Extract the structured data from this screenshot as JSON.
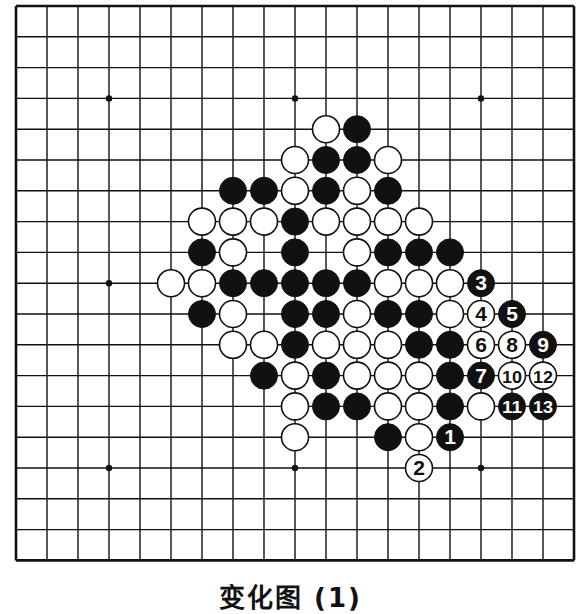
{
  "board": {
    "size": 19,
    "origin_x": 16,
    "origin_y": 6,
    "step_x": 31,
    "step_y": 30.8,
    "stone_radius": 13.5,
    "colors": {
      "line": "#111111",
      "black": "#111111",
      "white": "#ffffff",
      "background": "#ffffff"
    },
    "star_points": [
      [
        3,
        3
      ],
      [
        9,
        3
      ],
      [
        15,
        3
      ],
      [
        3,
        9
      ],
      [
        9,
        9
      ],
      [
        15,
        9
      ],
      [
        3,
        15
      ],
      [
        9,
        15
      ],
      [
        15,
        15
      ]
    ],
    "stones": [
      {
        "c": 10,
        "r": 4,
        "color": "W"
      },
      {
        "c": 11,
        "r": 4,
        "color": "B"
      },
      {
        "c": 9,
        "r": 5,
        "color": "W"
      },
      {
        "c": 10,
        "r": 5,
        "color": "B"
      },
      {
        "c": 11,
        "r": 5,
        "color": "B"
      },
      {
        "c": 12,
        "r": 5,
        "color": "W"
      },
      {
        "c": 7,
        "r": 6,
        "color": "B"
      },
      {
        "c": 8,
        "r": 6,
        "color": "B"
      },
      {
        "c": 9,
        "r": 6,
        "color": "W"
      },
      {
        "c": 10,
        "r": 6,
        "color": "B"
      },
      {
        "c": 11,
        "r": 6,
        "color": "W"
      },
      {
        "c": 12,
        "r": 6,
        "color": "B"
      },
      {
        "c": 6,
        "r": 7,
        "color": "W"
      },
      {
        "c": 7,
        "r": 7,
        "color": "W"
      },
      {
        "c": 8,
        "r": 7,
        "color": "W"
      },
      {
        "c": 9,
        "r": 7,
        "color": "B"
      },
      {
        "c": 10,
        "r": 7,
        "color": "W"
      },
      {
        "c": 11,
        "r": 7,
        "color": "W"
      },
      {
        "c": 12,
        "r": 7,
        "color": "W"
      },
      {
        "c": 13,
        "r": 7,
        "color": "W"
      },
      {
        "c": 6,
        "r": 8,
        "color": "B"
      },
      {
        "c": 7,
        "r": 8,
        "color": "W"
      },
      {
        "c": 9,
        "r": 8,
        "color": "B"
      },
      {
        "c": 11,
        "r": 8,
        "color": "W"
      },
      {
        "c": 12,
        "r": 8,
        "color": "B"
      },
      {
        "c": 13,
        "r": 8,
        "color": "B"
      },
      {
        "c": 14,
        "r": 8,
        "color": "B"
      },
      {
        "c": 5,
        "r": 9,
        "color": "W"
      },
      {
        "c": 6,
        "r": 9,
        "color": "W"
      },
      {
        "c": 7,
        "r": 9,
        "color": "B"
      },
      {
        "c": 8,
        "r": 9,
        "color": "B"
      },
      {
        "c": 9,
        "r": 9,
        "color": "B"
      },
      {
        "c": 10,
        "r": 9,
        "color": "B"
      },
      {
        "c": 11,
        "r": 9,
        "color": "B"
      },
      {
        "c": 12,
        "r": 9,
        "color": "W"
      },
      {
        "c": 13,
        "r": 9,
        "color": "W"
      },
      {
        "c": 14,
        "r": 9,
        "color": "W"
      },
      {
        "c": 6,
        "r": 10,
        "color": "B"
      },
      {
        "c": 7,
        "r": 10,
        "color": "W"
      },
      {
        "c": 9,
        "r": 10,
        "color": "B"
      },
      {
        "c": 10,
        "r": 10,
        "color": "B"
      },
      {
        "c": 11,
        "r": 10,
        "color": "W"
      },
      {
        "c": 12,
        "r": 10,
        "color": "B"
      },
      {
        "c": 13,
        "r": 10,
        "color": "B"
      },
      {
        "c": 14,
        "r": 10,
        "color": "W"
      },
      {
        "c": 7,
        "r": 11,
        "color": "W"
      },
      {
        "c": 8,
        "r": 11,
        "color": "W"
      },
      {
        "c": 9,
        "r": 11,
        "color": "B"
      },
      {
        "c": 10,
        "r": 11,
        "color": "W"
      },
      {
        "c": 11,
        "r": 11,
        "color": "W"
      },
      {
        "c": 12,
        "r": 11,
        "color": "W"
      },
      {
        "c": 13,
        "r": 11,
        "color": "B"
      },
      {
        "c": 14,
        "r": 11,
        "color": "B"
      },
      {
        "c": 8,
        "r": 12,
        "color": "B"
      },
      {
        "c": 9,
        "r": 12,
        "color": "W"
      },
      {
        "c": 10,
        "r": 12,
        "color": "B"
      },
      {
        "c": 11,
        "r": 12,
        "color": "W"
      },
      {
        "c": 12,
        "r": 12,
        "color": "W"
      },
      {
        "c": 13,
        "r": 12,
        "color": "W"
      },
      {
        "c": 14,
        "r": 12,
        "color": "B"
      },
      {
        "c": 9,
        "r": 13,
        "color": "W"
      },
      {
        "c": 10,
        "r": 13,
        "color": "B"
      },
      {
        "c": 11,
        "r": 13,
        "color": "B"
      },
      {
        "c": 12,
        "r": 13,
        "color": "W"
      },
      {
        "c": 13,
        "r": 13,
        "color": "W"
      },
      {
        "c": 14,
        "r": 13,
        "color": "B"
      },
      {
        "c": 15,
        "r": 13,
        "color": "W"
      },
      {
        "c": 9,
        "r": 14,
        "color": "W"
      },
      {
        "c": 12,
        "r": 14,
        "color": "B"
      },
      {
        "c": 13,
        "r": 14,
        "color": "W"
      }
    ],
    "numbered_moves": [
      {
        "n": 1,
        "c": 14,
        "r": 14,
        "color": "B"
      },
      {
        "n": 2,
        "c": 13,
        "r": 15,
        "color": "W"
      },
      {
        "n": 3,
        "c": 15,
        "r": 9,
        "color": "B"
      },
      {
        "n": 4,
        "c": 15,
        "r": 10,
        "color": "W"
      },
      {
        "n": 5,
        "c": 16,
        "r": 10,
        "color": "B"
      },
      {
        "n": 6,
        "c": 15,
        "r": 11,
        "color": "W"
      },
      {
        "n": 7,
        "c": 15,
        "r": 12,
        "color": "B"
      },
      {
        "n": 8,
        "c": 16,
        "r": 11,
        "color": "W"
      },
      {
        "n": 9,
        "c": 17,
        "r": 11,
        "color": "B"
      },
      {
        "n": 10,
        "c": 16,
        "r": 12,
        "color": "W"
      },
      {
        "n": 11,
        "c": 16,
        "r": 13,
        "color": "B"
      },
      {
        "n": 12,
        "c": 17,
        "r": 12,
        "color": "W"
      },
      {
        "n": 13,
        "c": 17,
        "r": 13,
        "color": "B"
      }
    ]
  },
  "caption": "变化图 (1)"
}
